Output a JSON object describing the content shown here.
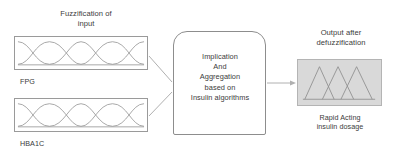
{
  "diagram": {
    "title_left": "Fuzzification of\ninput",
    "title_right": "Output after\ndefuzzification",
    "inputs": [
      {
        "caption": "FPG",
        "icon": "gaussian-membership-curves"
      },
      {
        "caption": "HBA1C",
        "icon": "gaussian-membership-curves"
      }
    ],
    "process": {
      "text": "Implication\nAnd\nAggregation\nbased on\nInsulin algorithms"
    },
    "output": {
      "caption": "Rapid Acting\ninsulin dosage",
      "icon": "triangular-membership-functions"
    },
    "colors": {
      "stroke": "#9a9a9a",
      "process_stroke": "#8d8d8d",
      "curve": "#9b9b9b",
      "output_fill": "#d9d9d9",
      "output_stroke": "#b4b4b4",
      "connector": "#b0b0b0",
      "text": "#3b3b3b",
      "background": "#ffffff"
    }
  }
}
